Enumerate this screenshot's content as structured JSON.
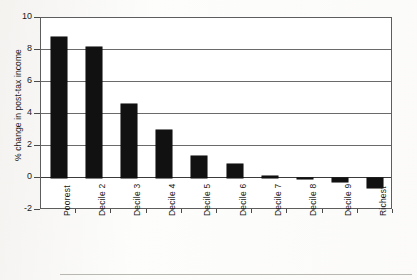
{
  "chart_data": {
    "type": "bar",
    "title": "",
    "xlabel": "",
    "ylabel": "% change in post-tax income",
    "categories": [
      "Poorest",
      "Decile 2",
      "Decile 3",
      "Decile 4",
      "Decile 5",
      "Decile 6",
      "Decile 7",
      "Decile 8",
      "Decile 9",
      "Richest"
    ],
    "values": [
      8.8,
      8.2,
      4.65,
      3.0,
      1.35,
      0.9,
      0.15,
      0.02,
      -0.25,
      -0.6
    ],
    "ylim": [
      -2,
      10
    ],
    "yticks": [
      -2,
      0,
      2,
      4,
      6,
      8,
      10
    ],
    "ytick_labels": [
      "-2",
      "0",
      "2",
      "4",
      "6",
      "8",
      "10"
    ],
    "grid": true,
    "grid_axis": "y",
    "legend": "none",
    "bar_color": "#111111",
    "xtick_rotation": 90
  },
  "axes": {
    "y_title": "% change in post-tax income",
    "tick_0": "10",
    "tick_1": "8",
    "tick_2": "6",
    "tick_3": "4",
    "tick_4": "2",
    "tick_5": "0",
    "tick_6": "-2"
  },
  "xlabels": {
    "c0": "Poorest",
    "c1": "Decile 2",
    "c2": "Decile 3",
    "c3": "Decile 4",
    "c4": "Decile 5",
    "c5": "Decile 6",
    "c6": "Decile 7",
    "c7": "Decile 8",
    "c8": "Decile 9",
    "c9": "Richest"
  }
}
